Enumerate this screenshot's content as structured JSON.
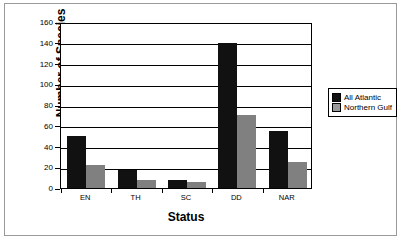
{
  "chart_data": {
    "type": "bar",
    "title": "",
    "xlabel": "Status",
    "ylabel": "Number of Species",
    "categories": [
      "EN",
      "TH",
      "SC",
      "DD",
      "NAR"
    ],
    "ylim": [
      0,
      160
    ],
    "yticks": [
      0,
      20,
      40,
      60,
      80,
      100,
      120,
      140,
      160
    ],
    "grid": true,
    "legend_position": "right",
    "series": [
      {
        "name": "All Atlantic",
        "color": "#111111",
        "values": [
          50,
          17,
          8,
          140,
          55
        ]
      },
      {
        "name": "Northern Gulf",
        "color": "#808080",
        "values": [
          22,
          8,
          6,
          70,
          25
        ]
      }
    ]
  },
  "axis": {
    "y_tick_labels": [
      "160",
      "140",
      "120",
      "100",
      "80",
      "60",
      "40",
      "20",
      "0"
    ],
    "y_title": "Number of Species",
    "x_title": "Status"
  },
  "legend": {
    "items": [
      {
        "label": "All Atlantic",
        "swatch": "black-square-icon"
      },
      {
        "label": "Northern Gulf",
        "swatch": "gray-square-icon"
      }
    ]
  }
}
